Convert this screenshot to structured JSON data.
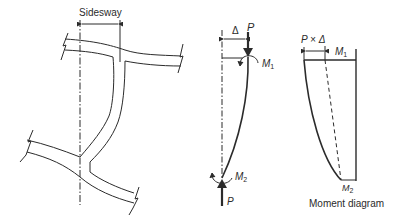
{
  "frame_figure": {
    "sidesway_label": "Sidesway"
  },
  "column_figure": {
    "delta_label": "Δ",
    "top_load_label": "P",
    "top_moment_label": "M",
    "top_moment_sub": "1",
    "bottom_moment_label": "M",
    "bottom_moment_sub": "2",
    "bottom_load_label": "P"
  },
  "moment_diagram": {
    "p_delta_label": "P × Δ",
    "top_moment_label": "M",
    "top_moment_sub": "1",
    "bottom_moment_label": "M",
    "bottom_moment_sub": "2",
    "caption": "Moment diagram"
  },
  "colors": {
    "line": "#2b2b2b",
    "background": "#ffffff"
  }
}
